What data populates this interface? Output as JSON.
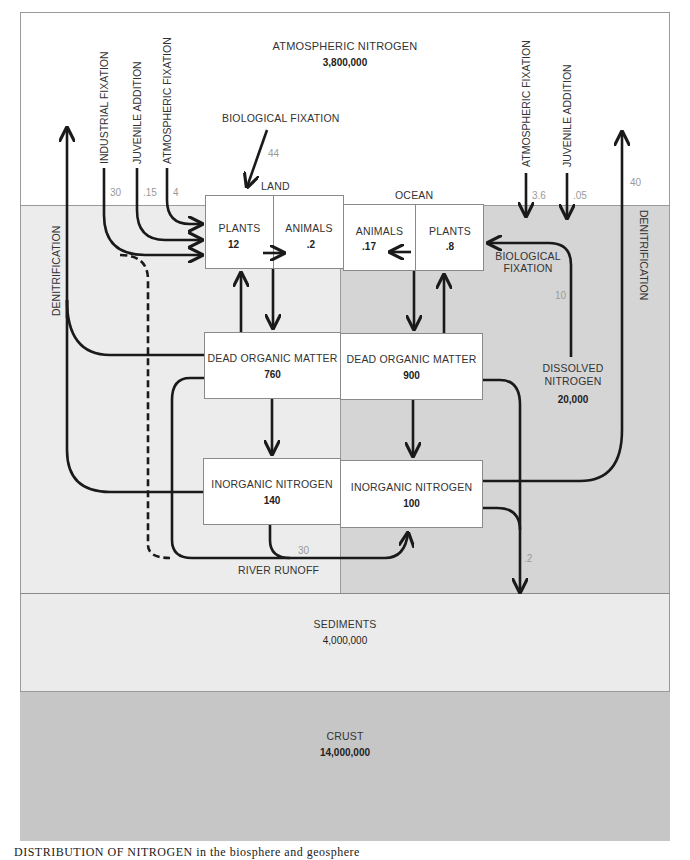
{
  "title": "Distribution of Nitrogen",
  "caption": "DISTRIBUTION OF NITROGEN in the biosphere and geosphere",
  "colors": {
    "atmosphere": "#ffffff",
    "land": "#ececec",
    "ocean": "#d5d5d5",
    "sediments": "#ebebeb",
    "crust": "#c6c6c6",
    "box": "#ffffff",
    "arrow": "#1a1a1a",
    "flow_label": "#9a9a9a"
  },
  "reservoirs": {
    "atmosphere": {
      "label": "ATMOSPHERIC NITROGEN",
      "value": "3,800,000"
    },
    "sediments": {
      "label": "SEDIMENTS",
      "value": "4,000,000"
    },
    "crust": {
      "label": "CRUST",
      "value": "14,000,000"
    },
    "dissolved": {
      "label_line1": "DISSOLVED",
      "label_line2": "NITROGEN",
      "value": "20,000"
    }
  },
  "land": {
    "heading": "LAND",
    "plants": {
      "label": "PLANTS",
      "value": "12"
    },
    "animals": {
      "label": "ANIMALS",
      "value": ".2"
    },
    "dead_organic": {
      "label": "DEAD ORGANIC MATTER",
      "value": "760"
    },
    "inorganic": {
      "label": "INORGANIC NITROGEN",
      "value": "140"
    }
  },
  "ocean": {
    "heading": "OCEAN",
    "animals": {
      "label": "ANIMALS",
      "value": ".17"
    },
    "plants": {
      "label": "PLANTS",
      "value": ".8"
    },
    "dead_organic": {
      "label": "DEAD ORGANIC MATTER",
      "value": "900"
    },
    "inorganic": {
      "label": "INORGANIC NITROGEN",
      "value": "100"
    }
  },
  "flows": {
    "land_industrial": {
      "label": "INDUSTRIAL FIXATION",
      "value": "30"
    },
    "land_juvenile": {
      "label": "JUVENILE ADDITION",
      "value": ".15"
    },
    "land_atmospheric": {
      "label": "ATMOSPHERIC FIXATION",
      "value": "4"
    },
    "land_biological": {
      "label": "BIOLOGICAL FIXATION",
      "value": "44"
    },
    "land_denitrification": {
      "label": "DENITRIFICATION"
    },
    "ocean_atmospheric": {
      "label": "ATMOSPHERIC FIXATION",
      "value": "3.6"
    },
    "ocean_juvenile": {
      "label": "JUVENILE ADDITION",
      "value": ".05"
    },
    "ocean_biological": {
      "label_line1": "BIOLOGICAL",
      "label_line2": "FIXATION",
      "value": "10"
    },
    "ocean_denitrification": {
      "label": "DENITRIFICATION",
      "value": "40"
    },
    "river_runoff": {
      "label": "RIVER RUNOFF",
      "value": "30"
    },
    "sediment_deposit": {
      "value": ".2"
    }
  }
}
